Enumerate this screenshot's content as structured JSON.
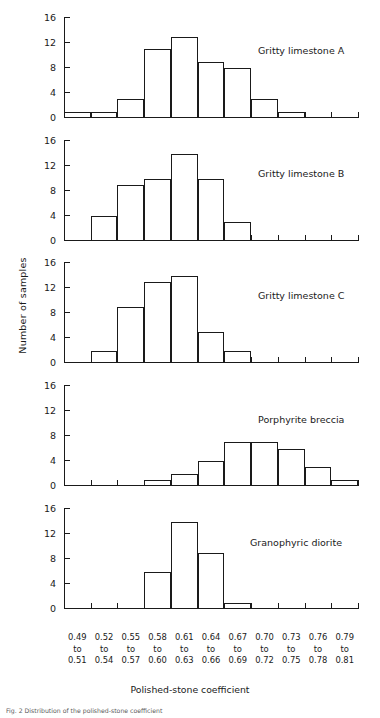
{
  "figure": {
    "ylabel": "Number of samples",
    "xtitle": "Polished-stone coefficient",
    "caption": "Fig. 2    Distribution of the polished-stone coefficient",
    "axis_color": "#1a1a1a"
  },
  "chart_data": {
    "type": "bar",
    "title": "",
    "subtitle": "",
    "xlabel": "Polished-stone coefficient",
    "ylabel": "Number of samples",
    "ylim": [
      0,
      16
    ],
    "yticks": [
      0,
      4,
      8,
      12,
      16
    ],
    "grid": false,
    "legend_position": "inside-top-right",
    "categories": [
      "0.49 to 0.51",
      "0.52 to 0.54",
      "0.55 to 0.57",
      "0.58 to 0.60",
      "0.61 to 0.63",
      "0.64 to 0.66",
      "0.67 to 0.69",
      "0.70 to 0.72",
      "0.73 to 0.75",
      "0.76 to 0.78",
      "0.79 to 0.81"
    ],
    "category_lines": [
      [
        "0.49",
        "to",
        "0.51"
      ],
      [
        "0.52",
        "to",
        "0.54"
      ],
      [
        "0.55",
        "to",
        "0.57"
      ],
      [
        "0.58",
        "to",
        "0.60"
      ],
      [
        "0.61",
        "to",
        "0.63"
      ],
      [
        "0.64",
        "to",
        "0.66"
      ],
      [
        "0.67",
        "to",
        "0.69"
      ],
      [
        "0.70",
        "to",
        "0.72"
      ],
      [
        "0.73",
        "to",
        "0.75"
      ],
      [
        "0.76",
        "to",
        "0.78"
      ],
      [
        "0.79",
        "to",
        "0.81"
      ]
    ],
    "series": [
      {
        "name": "Gritty limestone A",
        "values": [
          1,
          1,
          3,
          11,
          13,
          9,
          8,
          3,
          1,
          0,
          0
        ]
      },
      {
        "name": "Gritty limestone B",
        "values": [
          0,
          4,
          9,
          10,
          14,
          10,
          3,
          0,
          0,
          0,
          0
        ]
      },
      {
        "name": "Gritty limestone C",
        "values": [
          0,
          2,
          9,
          13,
          14,
          5,
          2,
          0,
          0,
          0,
          0
        ]
      },
      {
        "name": "Porphyrite breccia",
        "values": [
          0,
          0,
          0,
          1,
          2,
          4,
          7,
          7,
          6,
          3,
          1
        ]
      },
      {
        "name": "Granophyric diorite",
        "values": [
          0,
          0,
          0,
          6,
          14,
          9,
          1,
          0,
          0,
          0,
          0
        ]
      }
    ]
  },
  "panels": [
    {
      "label": "Gritty limestone A",
      "label_left": 258,
      "label_top": 45
    },
    {
      "label": "Gritty limestone B",
      "label_left": 258,
      "label_top": 168
    },
    {
      "label": "Gritty limestone C",
      "label_left": 258,
      "label_top": 290
    },
    {
      "label": "Porphyrite breccia",
      "label_left": 258,
      "label_top": 414
    },
    {
      "label": "Granophyric diorite",
      "label_left": 250,
      "label_top": 537
    }
  ]
}
